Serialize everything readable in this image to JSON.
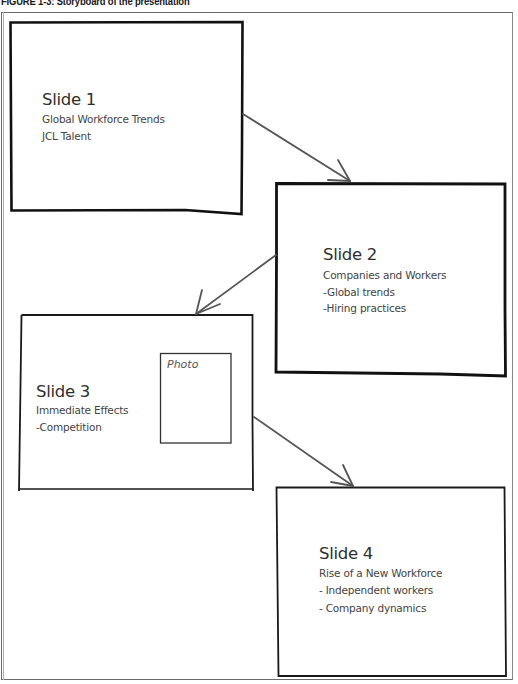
{
  "caption": "FIGURE 1-3: Storyboard of the presentation",
  "colors": {
    "box_border": "#111111",
    "arrow": "#555555",
    "text": "#3a3a3a",
    "frame": "#6a6a6a"
  },
  "slides": [
    {
      "title": "Slide 1",
      "lines": [
        "Global Workforce Trends",
        "JCL Talent"
      ]
    },
    {
      "title": "Slide 2",
      "lines": [
        "Companies and Workers",
        "-Global trends",
        "-Hiring practices"
      ]
    },
    {
      "title": "Slide 3",
      "lines": [
        "Immediate Effects",
        "-Competition"
      ],
      "photo_placeholder": "Photo"
    },
    {
      "title": "Slide 4",
      "lines": [
        "Rise of a New Workforce",
        "- Independent workers",
        "- Company dynamics"
      ]
    }
  ],
  "arrows": [
    {
      "from": "Slide 1",
      "to": "Slide 2"
    },
    {
      "from": "Slide 2",
      "to": "Slide 3"
    },
    {
      "from": "Slide 3",
      "to": "Slide 4"
    }
  ]
}
